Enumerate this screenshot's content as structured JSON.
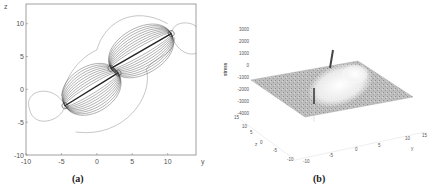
{
  "figure": {
    "panels": [
      {
        "caption": "(a)",
        "type": "contour",
        "xlabel": "y",
        "ylabel": "z",
        "xticks": [
          "-10",
          "-5",
          "0",
          "5",
          "10"
        ],
        "yticks": [
          "10",
          "5",
          "0",
          "-5",
          "-10"
        ]
      },
      {
        "caption": "(b)",
        "type": "surface",
        "zlabel": "stress",
        "zticks": [
          "3000",
          "2000",
          "1000",
          "0",
          "-1000",
          "-2000",
          "-3000",
          "-4000"
        ],
        "yaxis_label": "y",
        "yaxis_ticks": [
          "-10",
          "-5",
          "0",
          "5",
          "10",
          "15"
        ],
        "zaxis_depth_label": "z",
        "zaxis_depth_ticks": [
          "15",
          "10",
          "5",
          "0",
          "-5",
          "-10"
        ]
      }
    ]
  },
  "chart_data": [
    {
      "type": "contour",
      "title": "",
      "caption": "(a)",
      "xlabel": "y",
      "ylabel": "z",
      "xlim": [
        -10,
        14
      ],
      "ylim": [
        -10,
        13
      ],
      "xticks": [
        -10,
        -5,
        0,
        5,
        10
      ],
      "yticks": [
        -10,
        -5,
        0,
        5,
        10
      ],
      "cracks": [
        {
          "from": [
            -4.5,
            -2.5
          ],
          "to": [
            3,
            2.5
          ]
        },
        {
          "from": [
            2,
            3.2
          ],
          "to": [
            10.5,
            8.5
          ]
        }
      ],
      "grid": false
    },
    {
      "type": "surface",
      "title": "",
      "caption": "(b)",
      "zlabel": "stress",
      "zlim": [
        -4000,
        3000
      ],
      "zticks": [
        -4000,
        -3000,
        -2000,
        -1000,
        0,
        1000,
        2000,
        3000
      ],
      "ylabel": "y",
      "yticks": [
        -10,
        -5,
        0,
        5,
        10,
        15
      ],
      "depth_label": "z",
      "depth_ticks": [
        -10,
        -5,
        0,
        5,
        10,
        15
      ],
      "baseline_stress": -1500,
      "peak_stress": 2000,
      "min_stress": -3500,
      "grid": false
    }
  ]
}
